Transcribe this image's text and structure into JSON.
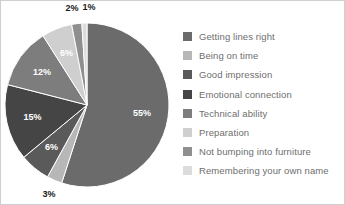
{
  "chart_data": {
    "type": "pie",
    "title": "",
    "subtitle": "",
    "xlabel": "",
    "ylabel": "",
    "grid": false,
    "legend_position": "right",
    "start_angle_deg": 0,
    "direction": "clockwise",
    "categories": [
      "Getting lines right",
      "Being on time",
      "Good impression",
      "Emotional connection",
      "Technical ability",
      "Preparation",
      "Not bumping into furniture",
      "Remembering your own name"
    ],
    "values": [
      55,
      3,
      6,
      15,
      12,
      6,
      2,
      1
    ],
    "value_labels": [
      "55%",
      "3%",
      "6%",
      "15%",
      "12%",
      "6%",
      "2%",
      "1%"
    ],
    "colors": [
      "#6b6b6b",
      "#b7b7b7",
      "#5a5a5a",
      "#454545",
      "#7d7d7d",
      "#cfcfcf",
      "#8f8f8f",
      "#dcdcdc"
    ],
    "label_placement": [
      "inside",
      "outside",
      "inside",
      "inside",
      "inside",
      "inside",
      "outside",
      "outside"
    ],
    "label_text_colors": [
      "#ffffff",
      "#1a1a1a",
      "#ffffff",
      "#ffffff",
      "#ffffff",
      "#ffffff",
      "#1a1a1a",
      "#1a1a1a"
    ]
  },
  "legend": {
    "items": [
      {
        "label": "Getting lines right",
        "color": "#6b6b6b"
      },
      {
        "label": "Being on time",
        "color": "#b7b7b7"
      },
      {
        "label": "Good impression",
        "color": "#5a5a5a"
      },
      {
        "label": "Emotional connection",
        "color": "#454545"
      },
      {
        "label": "Technical ability",
        "color": "#7d7d7d"
      },
      {
        "label": "Preparation",
        "color": "#cfcfcf"
      },
      {
        "label": "Not bumping into furniture",
        "color": "#8f8f8f"
      },
      {
        "label": "Remembering your own name",
        "color": "#dcdcdc"
      }
    ]
  },
  "figure": {
    "background": "#ffffff",
    "border_color": "#cfcfcf",
    "legend_text_color": "#6e6e6e"
  },
  "pie_geometry": {
    "center_x": 87,
    "center_y": 105,
    "radius": 82
  }
}
